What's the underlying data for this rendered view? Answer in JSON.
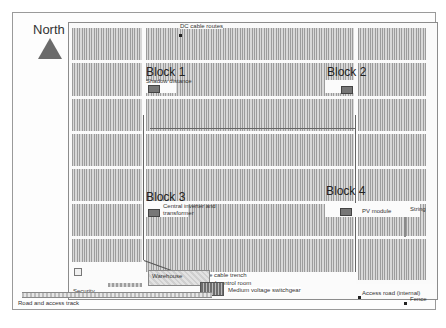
{
  "diagram": {
    "compass": {
      "label": "North",
      "icon": "north-arrow-triangle",
      "color": "#6b6b6b"
    },
    "blocks": [
      {
        "label": "Block 1",
        "annotation": "Shadow distance"
      },
      {
        "label": "Block 2"
      },
      {
        "label": "Block 3",
        "annotation": "Central inverter and transformer"
      },
      {
        "label": "Block 4",
        "annotations": [
          "PV module",
          "String"
        ]
      }
    ],
    "labels": {
      "dc_cable_routes": "DC cable routes",
      "shadow_distance": "Shadow distance",
      "central_inverter_line1": "Central inverter and",
      "central_inverter_line2": "transformer",
      "pv_module": "PV module",
      "string": "String",
      "mv_cable_trench": "Medium voltage cable trench",
      "office_control_room": "Office and control room",
      "mv_switchgear": "Medium voltage switchgear",
      "warehouse": "Warehouse",
      "security": "Security",
      "road_access_track": "Road and access track",
      "access_road_internal": "Access road (internal)",
      "fence": "Fence"
    },
    "colors": {
      "module_dark": "#9c9c9c",
      "module_light": "#d8d8d8",
      "road": "#fbfbfb",
      "outline": "#8c8c8c"
    }
  }
}
